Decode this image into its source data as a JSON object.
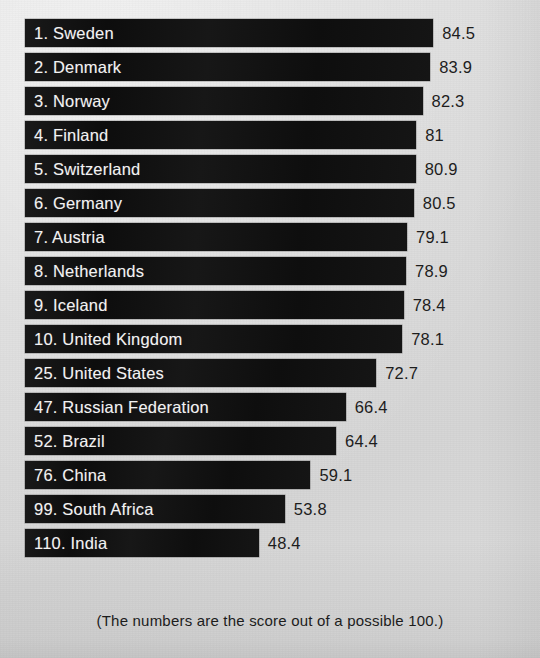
{
  "chart_data": {
    "type": "bar",
    "orientation": "horizontal",
    "title": "",
    "subtitle": "",
    "xlabel": "",
    "ylabel": "",
    "caption": "(The numbers are the score out of a possible 100.)",
    "xlim": [
      0,
      100
    ],
    "grid": false,
    "legend": null,
    "value_labels": true,
    "max_possible_score": 100,
    "categories": [
      "1. Sweden",
      "2. Denmark",
      "3. Norway",
      "4. Finland",
      "5. Switzerland",
      "6. Germany",
      "7. Austria",
      "8. Netherlands",
      "9. Iceland",
      "10. United Kingdom",
      "25. United States",
      "47. Russian Federation",
      "52. Brazil",
      "76. China",
      "99. South Africa",
      "110. India"
    ],
    "values": [
      84.5,
      83.9,
      82.3,
      81,
      80.9,
      80.5,
      79.1,
      78.9,
      78.4,
      78.1,
      72.7,
      66.4,
      64.4,
      59.1,
      53.8,
      48.4
    ],
    "value_text": [
      "84.5",
      "83.9",
      "82.3",
      "81",
      "80.9",
      "80.5",
      "79.1",
      "78.9",
      "78.4",
      "78.1",
      "72.7",
      "66.4",
      "64.4",
      "59.1",
      "53.8",
      "48.4"
    ],
    "rows": [
      {
        "rank": "1",
        "country": "Sweden",
        "label": "1. Sweden",
        "value": 84.5,
        "value_text": "84.5"
      },
      {
        "rank": "2",
        "country": "Denmark",
        "label": "2. Denmark",
        "value": 83.9,
        "value_text": "83.9"
      },
      {
        "rank": "3",
        "country": "Norway",
        "label": "3. Norway",
        "value": 82.3,
        "value_text": "82.3"
      },
      {
        "rank": "4",
        "country": "Finland",
        "label": "4. Finland",
        "value": 81,
        "value_text": "81"
      },
      {
        "rank": "5",
        "country": "Switzerland",
        "label": "5. Switzerland",
        "value": 80.9,
        "value_text": "80.9"
      },
      {
        "rank": "6",
        "country": "Germany",
        "label": "6. Germany",
        "value": 80.5,
        "value_text": "80.5"
      },
      {
        "rank": "7",
        "country": "Austria",
        "label": "7. Austria",
        "value": 79.1,
        "value_text": "79.1"
      },
      {
        "rank": "8",
        "country": "Netherlands",
        "label": "8. Netherlands",
        "value": 78.9,
        "value_text": "78.9"
      },
      {
        "rank": "9",
        "country": "Iceland",
        "label": "9. Iceland",
        "value": 78.4,
        "value_text": "78.4"
      },
      {
        "rank": "10",
        "country": "United Kingdom",
        "label": "10. United Kingdom",
        "value": 78.1,
        "value_text": "78.1"
      },
      {
        "rank": "25",
        "country": "United States",
        "label": "25. United States",
        "value": 72.7,
        "value_text": "72.7"
      },
      {
        "rank": "47",
        "country": "Russian Federation",
        "label": "47. Russian Federation",
        "value": 66.4,
        "value_text": "66.4"
      },
      {
        "rank": "52",
        "country": "Brazil",
        "label": "52. Brazil",
        "value": 64.4,
        "value_text": "64.4"
      },
      {
        "rank": "76",
        "country": "China",
        "label": "76. China",
        "value": 59.1,
        "value_text": "59.1"
      },
      {
        "rank": "99",
        "country": "South Africa",
        "label": "99. South Africa",
        "value": 53.8,
        "value_text": "53.8"
      },
      {
        "rank": "110",
        "country": "India",
        "label": "110. India",
        "value": 48.4,
        "value_text": "48.4"
      }
    ]
  },
  "style": {
    "bar_color": "#141414",
    "background_color": "#d8d8d8",
    "label_color": "#f2f2f2",
    "value_color": "#1d1d1d"
  },
  "layout": {
    "bar_origin_x": 25,
    "px_per_unit": 4.83,
    "row_pitch": 34,
    "bar_height": 28,
    "first_row_top": 19,
    "value_gap": 9
  }
}
